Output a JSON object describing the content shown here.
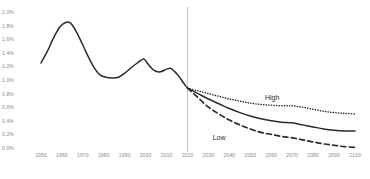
{
  "chart_data": {
    "type": "line",
    "title": "",
    "xlabel": "",
    "ylabel": "",
    "xlim": [
      1950,
      2100
    ],
    "ylim": [
      0.0,
      2.0
    ],
    "y_tick_suffix": "%",
    "grid": false,
    "legend_position": "inline-annotation",
    "y_ticks": [
      "2.0%",
      "1.8%",
      "1.6%",
      "1.4%",
      "1.2%",
      "1.0%",
      "0.8%",
      "0.6%",
      "0.4%",
      "0.2%",
      "0.0%"
    ],
    "y_tick_values": [
      2.0,
      1.8,
      1.6,
      1.4,
      1.2,
      1.0,
      0.8,
      0.6,
      0.4,
      0.2,
      0.0
    ],
    "x_ticks": [
      "1950",
      "1960",
      "1970",
      "1980",
      "1990",
      "2000",
      "2010",
      "2020",
      "2030",
      "2040",
      "2050",
      "2060",
      "2070",
      "2080",
      "2090",
      "2100"
    ],
    "x_tick_values": [
      1950,
      1960,
      1970,
      1980,
      1990,
      2000,
      2010,
      2020,
      2030,
      2040,
      2050,
      2060,
      2070,
      2080,
      2090,
      2100
    ],
    "divider_x": 2020,
    "annotations": [
      {
        "text": "High",
        "x": 2057,
        "y": 0.72
      },
      {
        "text": "Low",
        "x": 2032,
        "y": 0.13
      }
    ],
    "series": [
      {
        "name": "Historical",
        "style": "solid",
        "color": "#2b2b2b",
        "x": [
          1950,
          1953,
          1956,
          1959,
          1962,
          1964,
          1966,
          1969,
          1972,
          1975,
          1978,
          1981,
          1984,
          1987,
          1990,
          1993,
          1996,
          1999,
          2001,
          2004,
          2007,
          2010,
          2012,
          2014,
          2016,
          2018,
          2020
        ],
        "values": [
          1.25,
          1.42,
          1.62,
          1.78,
          1.85,
          1.84,
          1.76,
          1.58,
          1.38,
          1.2,
          1.08,
          1.04,
          1.03,
          1.04,
          1.1,
          1.18,
          1.25,
          1.31,
          1.24,
          1.14,
          1.12,
          1.16,
          1.17,
          1.12,
          1.05,
          0.96,
          0.88
        ]
      },
      {
        "name": "High",
        "style": "dotted",
        "color": "#2b2b2b",
        "x": [
          2020,
          2025,
          2030,
          2035,
          2040,
          2045,
          2050,
          2055,
          2060,
          2065,
          2070,
          2075,
          2080,
          2085,
          2090,
          2095,
          2100
        ],
        "values": [
          0.88,
          0.84,
          0.8,
          0.76,
          0.72,
          0.69,
          0.66,
          0.64,
          0.63,
          0.62,
          0.62,
          0.6,
          0.57,
          0.54,
          0.52,
          0.51,
          0.5
        ]
      },
      {
        "name": "Medium",
        "style": "solid",
        "color": "#2b2b2b",
        "x": [
          2020,
          2025,
          2030,
          2035,
          2040,
          2045,
          2050,
          2055,
          2060,
          2065,
          2070,
          2075,
          2080,
          2085,
          2090,
          2095,
          2100
        ],
        "values": [
          0.88,
          0.8,
          0.72,
          0.65,
          0.58,
          0.52,
          0.47,
          0.43,
          0.4,
          0.38,
          0.37,
          0.34,
          0.31,
          0.28,
          0.26,
          0.25,
          0.25
        ]
      },
      {
        "name": "Low",
        "style": "dashed",
        "color": "#2b2b2b",
        "x": [
          2020,
          2025,
          2030,
          2035,
          2040,
          2045,
          2050,
          2055,
          2060,
          2065,
          2070,
          2075,
          2080,
          2085,
          2090,
          2095,
          2100
        ],
        "values": [
          0.88,
          0.74,
          0.6,
          0.5,
          0.41,
          0.34,
          0.28,
          0.23,
          0.2,
          0.17,
          0.15,
          0.12,
          0.09,
          0.06,
          0.04,
          0.02,
          0.01
        ]
      }
    ]
  }
}
